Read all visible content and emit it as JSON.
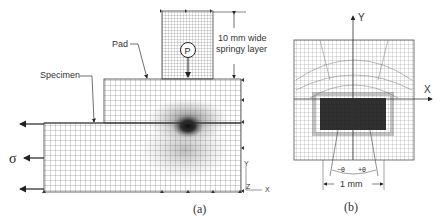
{
  "figure_a": {
    "caption": "(a)",
    "labels": {
      "pad": "Pad",
      "specimen": "Specimen",
      "layer_line1": "10 mm wide",
      "layer_line2": "springy layer",
      "load": "P",
      "stress": "σ",
      "axis_y": "Y",
      "axis_x": "X",
      "axis_z": "Z"
    }
  },
  "figure_b": {
    "caption": "(b)",
    "labels": {
      "axis_y": "Y",
      "axis_x": "X",
      "theta_neg": "−θ",
      "theta_pos": "+θ",
      "dimension": "1 mm"
    }
  },
  "colors": {
    "mesh": "#555555",
    "dense": "#1a1a1a",
    "text": "#333333"
  }
}
